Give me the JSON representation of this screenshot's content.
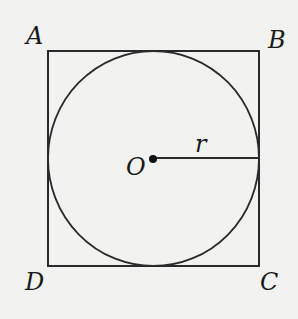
{
  "diagram": {
    "vertices": {
      "A": "A",
      "B": "B",
      "C": "C",
      "D": "D"
    },
    "center_label": "O",
    "radius_label": "r",
    "colors": {
      "stroke": "#2a2a2a",
      "background": "#f2f2f0"
    }
  }
}
